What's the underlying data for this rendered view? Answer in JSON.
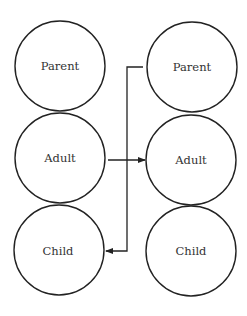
{
  "diagram": {
    "type": "transactional-analysis",
    "left_column": {
      "states": [
        {
          "label": "Parent",
          "cx": 60,
          "cy": 66
        },
        {
          "label": "Adult",
          "cx": 60,
          "cy": 158
        },
        {
          "label": "Child",
          "cx": 59,
          "cy": 250
        }
      ]
    },
    "right_column": {
      "states": [
        {
          "label": "Parent",
          "cx": 192,
          "cy": 67
        },
        {
          "label": "Adult",
          "cx": 191,
          "cy": 160
        },
        {
          "label": "Child",
          "cx": 191,
          "cy": 251
        }
      ]
    },
    "radius": 45,
    "transactions": [
      {
        "from": "left.Adult",
        "to": "right.Adult"
      },
      {
        "from": "right.Parent",
        "to": "left.Child"
      }
    ],
    "stroke_color": "#222222"
  }
}
